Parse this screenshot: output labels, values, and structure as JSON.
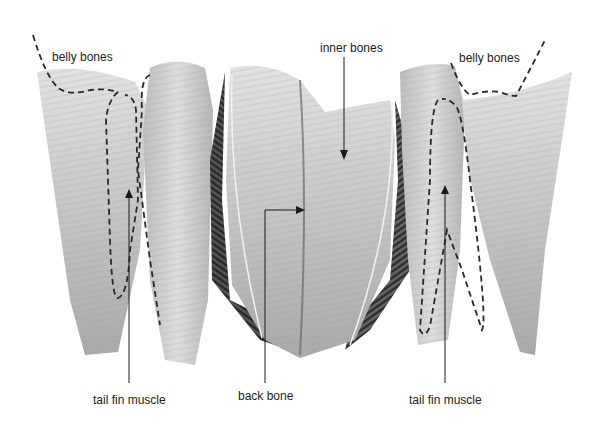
{
  "figure": {
    "background_color": "#ffffff",
    "fillet_color": "#c9c9c9",
    "ink_color": "#222222"
  },
  "labels": [
    {
      "id": "belly-bones-left",
      "text": "belly bones",
      "x": 52,
      "y": 50
    },
    {
      "id": "inner-bones",
      "text": "inner bones",
      "x": 320,
      "y": 41
    },
    {
      "id": "belly-bones-right",
      "text": "belly bones",
      "x": 459,
      "y": 51
    },
    {
      "id": "tail-fin-muscle-left",
      "text": "tail fin muscle",
      "x": 93,
      "y": 393
    },
    {
      "id": "back-bone",
      "text": "back bone",
      "x": 238,
      "y": 389
    },
    {
      "id": "tail-fin-muscle-right",
      "text": "tail fin muscle",
      "x": 409,
      "y": 393
    }
  ],
  "fillets": [
    {
      "id": "left-pair",
      "position": "left"
    },
    {
      "id": "center-fillet",
      "position": "center"
    },
    {
      "id": "right-pair",
      "position": "right"
    }
  ]
}
